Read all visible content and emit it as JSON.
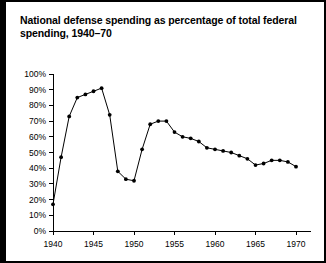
{
  "figure": {
    "title": "National defense spending as percentage of total federal spending, 1940–70",
    "border_color": "#000000",
    "background_color": "#ffffff"
  },
  "chart_data": {
    "type": "line",
    "title": "National defense spending as percentage of total federal spending, 1940–70",
    "xlabel": "",
    "ylabel": "",
    "xlim": [
      1939,
      1971
    ],
    "ylim": [
      0,
      100
    ],
    "grid": false,
    "legend": null,
    "line_color": "#000000",
    "marker": "circle",
    "marker_color": "#000000",
    "y_tick_labels": [
      "0%",
      "10%",
      "20%",
      "30%",
      "40%",
      "50%",
      "60%",
      "70%",
      "80%",
      "90%",
      "100%"
    ],
    "y_tick_values": [
      0,
      10,
      20,
      30,
      40,
      50,
      60,
      70,
      80,
      90,
      100
    ],
    "x_tick_labels": [
      "1940",
      "1945",
      "1950",
      "1955",
      "1960",
      "1965",
      "1970"
    ],
    "x_tick_values": [
      1940,
      1945,
      1950,
      1955,
      1960,
      1965,
      1970
    ],
    "x": [
      1940,
      1941,
      1942,
      1943,
      1944,
      1945,
      1946,
      1947,
      1948,
      1949,
      1950,
      1951,
      1952,
      1953,
      1954,
      1955,
      1956,
      1957,
      1958,
      1959,
      1960,
      1961,
      1962,
      1963,
      1964,
      1965,
      1966,
      1967,
      1968,
      1969,
      1970
    ],
    "values": [
      17,
      47,
      73,
      85,
      87,
      89,
      91,
      74,
      38,
      33,
      32,
      52,
      68,
      70,
      70,
      63,
      60,
      59,
      57,
      53,
      52,
      51,
      50,
      48,
      46,
      42,
      43,
      45,
      45,
      44,
      41
    ]
  }
}
